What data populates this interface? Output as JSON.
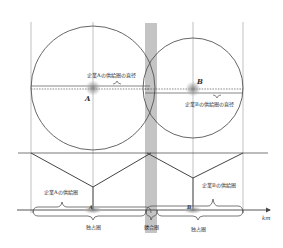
{
  "diagram": {
    "points": {
      "a": "A",
      "b": "B"
    },
    "labels": {
      "diameter_a": "企業Aの供給圏の直径",
      "diameter_b": "企業Bの供給圏の直径",
      "area_a": "企業Aの供給圏",
      "area_b": "企業Bの供給圏",
      "monopoly_left": "独占圏",
      "competition": "競合圏",
      "monopoly_right": "独占圏",
      "axis_unit": "km"
    },
    "colors": {
      "line": "#555555",
      "band": "#bdbdbd",
      "dot": "#9a9a9a"
    }
  }
}
